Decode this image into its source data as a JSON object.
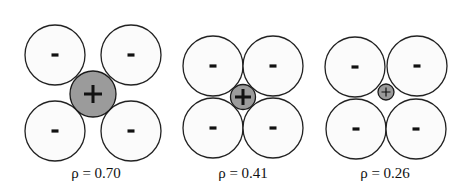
{
  "figure": {
    "width": 459,
    "height": 186,
    "colors": {
      "anion_fill": "#fbfbfb",
      "anion_stroke": "#222222",
      "cation_fill": "#9b9b9b",
      "cation_stroke": "#1a1a1a",
      "text": "#111111"
    },
    "panels": [
      {
        "id": "panel-1",
        "label": "ρ = 0.70",
        "label_pos": [
          96,
          178
        ],
        "anion_radius": 30,
        "anions": [
          {
            "cx": 55,
            "cy": 55,
            "sign": "-"
          },
          {
            "cx": 131,
            "cy": 55,
            "sign": "-"
          },
          {
            "cx": 55,
            "cy": 131,
            "sign": "-"
          },
          {
            "cx": 131,
            "cy": 131,
            "sign": "-"
          }
        ],
        "cation": {
          "cx": 93,
          "cy": 94,
          "r": 23,
          "sign": "+",
          "plus_size": 9,
          "plus_width": 3
        }
      },
      {
        "id": "panel-2",
        "label": "ρ = 0.41",
        "label_pos": [
          243,
          178
        ],
        "anion_radius": 30,
        "anions": [
          {
            "cx": 213,
            "cy": 66,
            "sign": "-"
          },
          {
            "cx": 273,
            "cy": 66,
            "sign": "-"
          },
          {
            "cx": 213,
            "cy": 128,
            "sign": "-"
          },
          {
            "cx": 273,
            "cy": 128,
            "sign": "-"
          }
        ],
        "cation": {
          "cx": 243,
          "cy": 97,
          "r": 12.5,
          "sign": "+",
          "plus_size": 8,
          "plus_width": 3
        }
      },
      {
        "id": "panel-3",
        "label": "ρ = 0.26",
        "label_pos": [
          385,
          178
        ],
        "anion_radius": 30,
        "anions": [
          {
            "cx": 355,
            "cy": 67,
            "sign": "-"
          },
          {
            "cx": 417,
            "cy": 66,
            "sign": "-"
          },
          {
            "cx": 356,
            "cy": 129,
            "sign": "-"
          },
          {
            "cx": 416,
            "cy": 129,
            "sign": "-"
          }
        ],
        "cation": {
          "cx": 386,
          "cy": 92,
          "r": 8,
          "sign": "+",
          "plus_size": 4.5,
          "plus_width": 1.2
        }
      }
    ]
  }
}
